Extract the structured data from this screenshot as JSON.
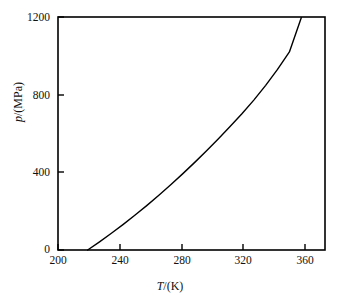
{
  "chart_data": {
    "type": "line",
    "title": "",
    "xlabel": "T/(K)",
    "ylabel": "p/(MPa)",
    "xlabel_symbol": "T",
    "xlabel_rest": "/(K)",
    "ylabel_symbol": "p",
    "ylabel_rest": "/(MPa)",
    "xlim": [
      200,
      380
    ],
    "ylim": [
      0,
      1200
    ],
    "xticks": [
      200,
      240,
      280,
      320,
      360
    ],
    "xtick_labels": [
      "200",
      "240",
      "280",
      "320",
      "360"
    ],
    "yticks": [
      0,
      400,
      800,
      1200
    ],
    "ytick_labels": [
      "0",
      "400",
      "800",
      "1200"
    ],
    "grid": false,
    "legend": false,
    "tick_direction": "in",
    "frame": "box",
    "line_color": "#000000",
    "line_width": 1.4,
    "series": [
      {
        "name": "melting curve",
        "x": [
          220,
          228,
          236,
          244,
          252,
          260,
          268,
          276,
          284,
          292,
          300,
          308,
          316,
          324,
          332,
          340,
          348,
          356,
          364
        ],
        "y": [
          0,
          42,
          86,
          132,
          180,
          230,
          282,
          336,
          392,
          450,
          510,
          572,
          636,
          702,
          772,
          848,
          930,
          1020,
          1196
        ]
      }
    ],
    "annotations": []
  },
  "axes": {
    "plot_box": {
      "left": 58,
      "top": 17,
      "right": 325,
      "bottom": 250
    }
  }
}
